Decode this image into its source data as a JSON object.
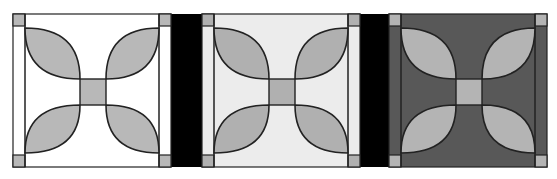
{
  "figure": {
    "width": 557,
    "height": 179,
    "background": "#ffffff",
    "outline_color": "#222222",
    "separator_color": "#000000"
  },
  "layout": {
    "top": 14,
    "tile_height": 153,
    "tiles_x": [
      13,
      202,
      389
    ],
    "tile_width": 158,
    "separators": [
      {
        "x": 171,
        "width": 31
      },
      {
        "x": 360,
        "width": 29
      }
    ],
    "corner_square": 12,
    "center_square": {
      "x0": 67,
      "y0": 65,
      "x1": 93,
      "y1": 91
    }
  },
  "tiles": [
    {
      "name": "light-colorway",
      "background": "#ffffff",
      "petal": "#b8b8b8",
      "center": "#b8b8b8",
      "corner": "#b8b8b8"
    },
    {
      "name": "pale-gray-colorway",
      "background": "#ececec",
      "petal": "#b0b0b0",
      "center": "#b0b0b0",
      "corner": "#b0b0b0"
    },
    {
      "name": "dark-colorway",
      "background": "#585858",
      "petal": "#b4b4b4",
      "center": "#b4b4b4",
      "corner": "#b4b4b4"
    }
  ]
}
